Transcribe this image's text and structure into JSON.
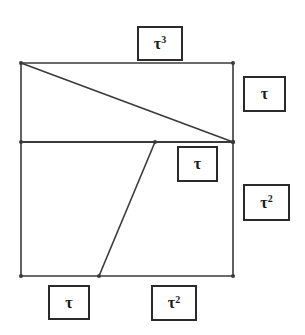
{
  "diagram": {
    "type": "geometric-rectangle-dissection",
    "colors": {
      "line": "#3a3a3a",
      "box_border": "#2a2a2a",
      "text": "#1a1a1a",
      "background": "#ffffff"
    },
    "points": {
      "top_left": [
        21,
        63
      ],
      "top_right": [
        233,
        63
      ],
      "mid_left": [
        21,
        142
      ],
      "mid_right": [
        233,
        142
      ],
      "mid_split": [
        155,
        142
      ],
      "bottom_left": [
        21,
        276
      ],
      "bottom_right": [
        233,
        276
      ],
      "bottom_split": [
        99,
        276
      ]
    },
    "labels": [
      {
        "id": "top",
        "base": "τ",
        "exponent": "3",
        "box": [
          137,
          26,
          46,
          35
        ]
      },
      {
        "id": "right-upper",
        "base": "τ",
        "exponent": "",
        "box": [
          243,
          76,
          43,
          36
        ]
      },
      {
        "id": "middle-inner",
        "base": "τ",
        "exponent": "",
        "box": [
          177,
          146,
          41,
          36
        ]
      },
      {
        "id": "right-lower",
        "base": "τ",
        "exponent": "2",
        "box": [
          243,
          184,
          47,
          37
        ]
      },
      {
        "id": "bottom-left",
        "base": "τ",
        "exponent": "",
        "box": [
          48,
          285,
          42,
          35
        ]
      },
      {
        "id": "bottom-right",
        "base": "τ",
        "exponent": "2",
        "box": [
          151,
          285,
          46,
          36
        ]
      }
    ]
  }
}
